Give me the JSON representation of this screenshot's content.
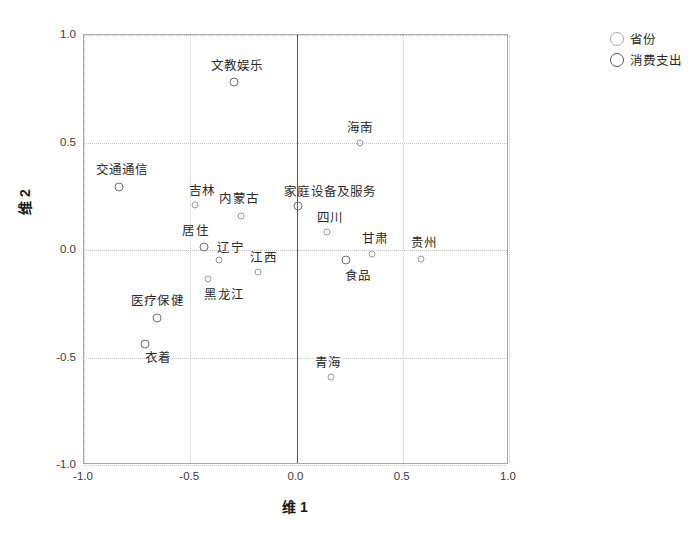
{
  "chart_data": {
    "type": "scatter",
    "title": "",
    "xlabel": "维 1",
    "ylabel": "维 2",
    "xlim": [
      -1.0,
      1.0
    ],
    "ylim": [
      -1.0,
      1.0
    ],
    "xticks": [
      "-1.0",
      "-0.5",
      "0.0",
      "0.5",
      "1.0"
    ],
    "xtick_values": [
      -1.0,
      -0.5,
      0.0,
      0.5,
      1.0
    ],
    "yticks": [
      "1.0",
      "0.5",
      "0.0",
      "-0.5",
      "-1.0"
    ],
    "ytick_values": [
      1.0,
      0.5,
      0.0,
      -0.5,
      -1.0
    ],
    "grid": true,
    "legend_position": "top-right",
    "series": [
      {
        "name": "省份",
        "marker": "open-circle-small",
        "color": "#9a9a9a",
        "points": [
          {
            "label": "海南",
            "x": 0.3,
            "y": 0.5,
            "label_dx": 0.0,
            "label_dy": 0.075
          },
          {
            "label": "吉林",
            "x": -0.48,
            "y": 0.21,
            "label_dx": 0.035,
            "label_dy": 0.075
          },
          {
            "label": "内蒙古",
            "x": -0.26,
            "y": 0.16,
            "label_dx": -0.01,
            "label_dy": 0.085
          },
          {
            "label": "四川",
            "x": 0.145,
            "y": 0.085,
            "label_dx": 0.015,
            "label_dy": 0.075
          },
          {
            "label": "甘肃",
            "x": 0.355,
            "y": -0.02,
            "label_dx": 0.015,
            "label_dy": 0.08
          },
          {
            "label": "贵州",
            "x": 0.585,
            "y": -0.04,
            "label_dx": 0.015,
            "label_dy": 0.08
          },
          {
            "label": "辽宁",
            "x": -0.365,
            "y": -0.045,
            "label_dx": 0.055,
            "label_dy": 0.065
          },
          {
            "label": "江西",
            "x": -0.18,
            "y": -0.1,
            "label_dx": 0.025,
            "label_dy": 0.07
          },
          {
            "label": "黑龙江",
            "x": -0.415,
            "y": -0.135,
            "label_dx": 0.075,
            "label_dy": -0.065
          },
          {
            "label": "青海",
            "x": 0.16,
            "y": -0.59,
            "label_dx": -0.01,
            "label_dy": 0.075
          }
        ]
      },
      {
        "name": "消费支出",
        "marker": "open-circle-large",
        "color": "#6f6f6f",
        "points": [
          {
            "label": "文教娱乐",
            "x": -0.295,
            "y": 0.78,
            "label_dx": 0.015,
            "label_dy": 0.085
          },
          {
            "label": "交通通信",
            "x": -0.835,
            "y": 0.295,
            "label_dx": 0.015,
            "label_dy": 0.085
          },
          {
            "label": "家庭设备及服务",
            "x": 0.005,
            "y": 0.205,
            "label_dx": 0.155,
            "label_dy": 0.075
          },
          {
            "label": "居住",
            "x": -0.435,
            "y": 0.015,
            "label_dx": -0.04,
            "label_dy": 0.085
          },
          {
            "label": "食品",
            "x": 0.235,
            "y": -0.045,
            "label_dx": 0.055,
            "label_dy": -0.065
          },
          {
            "label": "医疗保健",
            "x": -0.655,
            "y": -0.315,
            "label_dx": 0.0,
            "label_dy": 0.085
          },
          {
            "label": "衣着",
            "x": -0.715,
            "y": -0.435,
            "label_dx": 0.065,
            "label_dy": -0.06
          }
        ]
      }
    ],
    "legend": [
      {
        "label": "省份",
        "marker": "open-circle-small"
      },
      {
        "label": "消费支出",
        "marker": "open-circle-large"
      }
    ]
  }
}
